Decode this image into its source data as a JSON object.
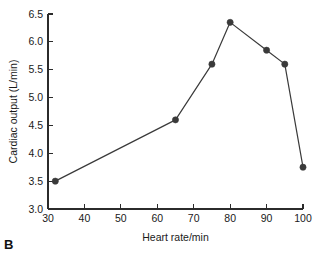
{
  "panel": {
    "label": "B"
  },
  "chart_data": {
    "type": "line",
    "title": "",
    "subtitle": "",
    "xlabel": "Heart rate/min",
    "ylabel": "Cardiac output (L/min)",
    "xlim": [
      30,
      100
    ],
    "ylim": [
      3.0,
      6.5
    ],
    "xticks": [
      30,
      40,
      50,
      60,
      70,
      80,
      90,
      100
    ],
    "xticklabels": [
      "30",
      "40",
      "50",
      "60",
      "70",
      "80",
      "90",
      "100"
    ],
    "yticks": [
      3.0,
      3.5,
      4.0,
      4.5,
      5.0,
      5.5,
      6.0,
      6.5
    ],
    "yticklabels": [
      "3.0",
      "3.5",
      "4.0",
      "4.5",
      "5.0",
      "5.5",
      "6.0",
      "6.5"
    ],
    "grid": false,
    "legend": false,
    "legend_position": "none",
    "marker": "filled-circle",
    "line_color": "#3a3a3a",
    "marker_color": "#3a3a3a",
    "axis_color": "#2b2b2b",
    "background_color": "#ffffff",
    "x": [
      32,
      65,
      75,
      80,
      90,
      95,
      100
    ],
    "y": [
      3.5,
      4.6,
      5.6,
      6.35,
      5.85,
      5.6,
      3.75
    ],
    "points": [
      {
        "x": 32,
        "y": 3.5
      },
      {
        "x": 65,
        "y": 4.6
      },
      {
        "x": 75,
        "y": 5.6
      },
      {
        "x": 80,
        "y": 6.35
      },
      {
        "x": 90,
        "y": 5.85
      },
      {
        "x": 95,
        "y": 5.6
      },
      {
        "x": 100,
        "y": 3.75
      }
    ],
    "series": [
      {
        "name": "Cardiac output",
        "x": [
          32,
          65,
          75,
          80,
          90,
          95,
          100
        ],
        "values": [
          3.5,
          4.6,
          5.6,
          6.35,
          5.85,
          5.6,
          3.75
        ]
      }
    ]
  }
}
